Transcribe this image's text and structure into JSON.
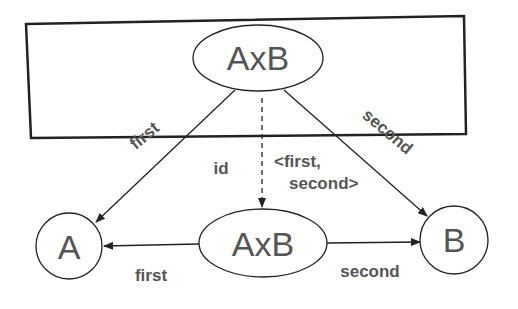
{
  "diagram": {
    "nodes": {
      "top_product": "AxB",
      "middle_product": "AxB",
      "a": "A",
      "b": "B"
    },
    "edges": {
      "top_to_a": "first",
      "top_to_b": "second",
      "top_to_middle_left": "id",
      "top_to_middle_right_line1": "<first,",
      "top_to_middle_right_line2": "second>",
      "middle_to_a": "first",
      "middle_to_b": "second"
    },
    "colors": {
      "stroke": "#222222",
      "text": "#555555",
      "background": "#ffffff"
    }
  }
}
